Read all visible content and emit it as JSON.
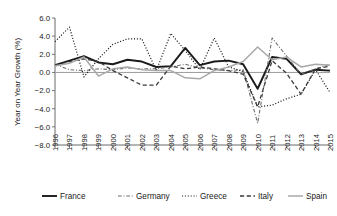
{
  "chart_data": {
    "type": "line",
    "title": "",
    "xlabel": "",
    "ylabel": "Year on Year Growth (%)",
    "ylim": [
      -8.0,
      6.0
    ],
    "yticks": [
      6.0,
      4.0,
      2.0,
      0.0,
      -2.0,
      -4.0,
      -6.0,
      -8.0
    ],
    "ytick_labels": [
      "6.0",
      "4.0",
      "2.0",
      "0.0",
      "-2.0",
      "-4.0",
      "-6.0",
      "-8.0"
    ],
    "grid": false,
    "legend_position": "bottom",
    "x": [
      1996,
      1997,
      1998,
      1999,
      2000,
      2001,
      2002,
      2003,
      2004,
      2005,
      2006,
      2007,
      2008,
      2009,
      2010,
      2011,
      2012,
      2013,
      2014,
      2015
    ],
    "xtick_labels": [
      "1996",
      "1997",
      "1998",
      "1999",
      "2000",
      "2001",
      "2002",
      "2003",
      "2004",
      "2005",
      "2006",
      "2007",
      "2008",
      "2009",
      "2010",
      "2011",
      "2012",
      "2013",
      "2014",
      "2015"
    ],
    "series": [
      {
        "name": "France",
        "color": "#1a1a1a",
        "dash": "none",
        "width": 1.9,
        "values": [
          0.8,
          1.3,
          1.8,
          1.1,
          0.9,
          1.4,
          1.2,
          0.6,
          0.7,
          2.7,
          0.8,
          1.2,
          1.3,
          0.9,
          -1.8,
          1.7,
          1.5,
          -0.2,
          0.3,
          0.2
        ]
      },
      {
        "name": "Germany",
        "color": "#6e6e6e",
        "dash": "dashdot",
        "width": 1.1,
        "values": [
          0.9,
          0.3,
          0.2,
          0.4,
          0.3,
          0.5,
          0.4,
          0.4,
          0.6,
          0.9,
          0.5,
          0.3,
          0.2,
          0.3,
          -5.6,
          3.8,
          1.8,
          -0.2,
          0.4,
          0.9
        ]
      },
      {
        "name": "Greece",
        "color": "#1a1a1a",
        "dash": "dotted",
        "width": 1.2,
        "values": [
          3.4,
          5.0,
          -0.5,
          1.5,
          3.1,
          3.7,
          3.7,
          0.2,
          4.3,
          2.4,
          0.3,
          3.8,
          0.6,
          0.1,
          -3.8,
          -3.6,
          -2.9,
          -2.4,
          0.3,
          -2.2
        ]
      },
      {
        "name": "Italy",
        "color": "#3a3a3a",
        "dash": "dashed",
        "width": 1.3,
        "values": [
          0.8,
          1.2,
          1.5,
          1.2,
          0.2,
          -0.6,
          -1.4,
          -1.4,
          0.7,
          0.4,
          0.6,
          0.4,
          0.2,
          -0.2,
          -3.8,
          1.3,
          -0.1,
          -2.4,
          0.4,
          0.7
        ]
      },
      {
        "name": "Spain",
        "color": "#a8a8a8",
        "dash": "none",
        "width": 1.5,
        "values": [
          0.7,
          1.0,
          1.7,
          -0.4,
          0.4,
          0.6,
          0.3,
          0.2,
          0.2,
          -0.6,
          -0.7,
          0.2,
          0.6,
          1.2,
          2.8,
          1.4,
          1.7,
          0.6,
          0.9,
          0.8
        ]
      }
    ]
  },
  "legend": {
    "items": [
      {
        "label": "France"
      },
      {
        "label": "Germany"
      },
      {
        "label": "Greece"
      },
      {
        "label": "Italy"
      },
      {
        "label": "Spain"
      }
    ]
  }
}
